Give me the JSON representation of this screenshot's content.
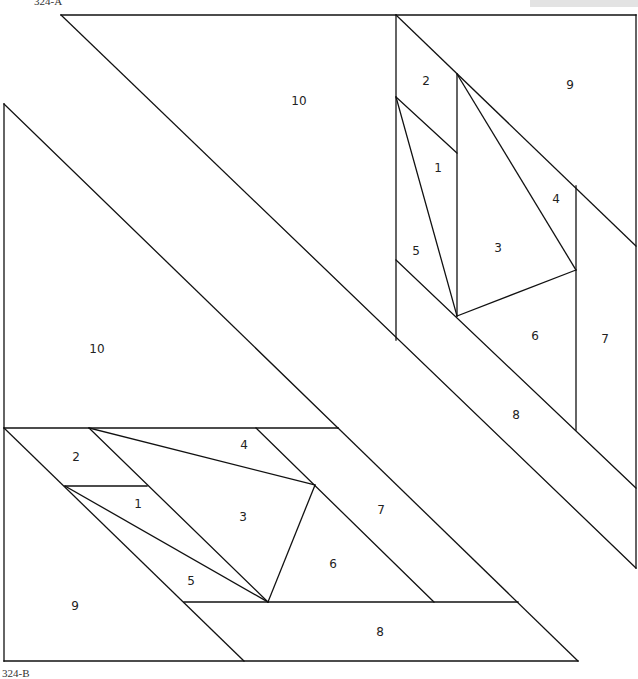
{
  "figures": [
    {
      "caption": "324-A",
      "caption_pos": {
        "x": 34,
        "y": -5
      },
      "labels": [
        {
          "text": "10",
          "x": 299,
          "y": 101
        },
        {
          "text": "2",
          "x": 426,
          "y": 81
        },
        {
          "text": "9",
          "x": 570,
          "y": 85
        },
        {
          "text": "1",
          "x": 438,
          "y": 168
        },
        {
          "text": "4",
          "x": 556,
          "y": 199
        },
        {
          "text": "5",
          "x": 416,
          "y": 251
        },
        {
          "text": "3",
          "x": 498,
          "y": 248
        },
        {
          "text": "6",
          "x": 535,
          "y": 336
        },
        {
          "text": "7",
          "x": 605,
          "y": 339
        },
        {
          "text": "8",
          "x": 516,
          "y": 415
        }
      ]
    },
    {
      "caption": "324-B",
      "caption_pos": {
        "x": 2,
        "y": 667
      },
      "labels": [
        {
          "text": "10",
          "x": 97,
          "y": 349
        },
        {
          "text": "2",
          "x": 76,
          "y": 457
        },
        {
          "text": "4",
          "x": 244,
          "y": 445
        },
        {
          "text": "1",
          "x": 138,
          "y": 504
        },
        {
          "text": "3",
          "x": 243,
          "y": 517
        },
        {
          "text": "7",
          "x": 381,
          "y": 510
        },
        {
          "text": "6",
          "x": 333,
          "y": 564
        },
        {
          "text": "5",
          "x": 191,
          "y": 581
        },
        {
          "text": "9",
          "x": 75,
          "y": 606
        },
        {
          "text": "8",
          "x": 380,
          "y": 632
        }
      ]
    }
  ],
  "segments": [
    [
      61,
      15,
      636,
      15
    ],
    [
      636,
      15,
      636,
      568
    ],
    [
      61,
      15,
      636,
      568
    ],
    [
      396,
      15,
      396,
      340
    ],
    [
      396,
      15,
      636,
      246
    ],
    [
      396,
      260,
      636,
      488
    ],
    [
      396,
      97,
      457,
      153
    ],
    [
      457,
      74,
      457,
      316
    ],
    [
      396,
      97,
      457,
      316
    ],
    [
      457,
      74,
      576,
      270
    ],
    [
      576,
      186,
      576,
      430
    ],
    [
      457,
      316,
      576,
      270
    ],
    [
      4,
      104,
      4,
      661
    ],
    [
      4,
      104,
      338,
      428
    ],
    [
      4,
      428,
      338,
      428
    ],
    [
      4,
      661,
      578,
      661
    ],
    [
      4,
      428,
      244,
      661
    ],
    [
      89,
      428,
      268,
      602
    ],
    [
      89,
      428,
      315,
      485
    ],
    [
      256,
      428,
      434,
      602
    ],
    [
      338,
      428,
      578,
      661
    ],
    [
      65,
      486,
      147,
      486
    ],
    [
      65,
      486,
      268,
      602
    ],
    [
      184,
      602,
      518,
      602
    ],
    [
      268,
      602,
      315,
      485
    ]
  ],
  "colors": {
    "stroke": "#111111",
    "background": "#ffffff",
    "header_bar": "#e3e3e3"
  }
}
